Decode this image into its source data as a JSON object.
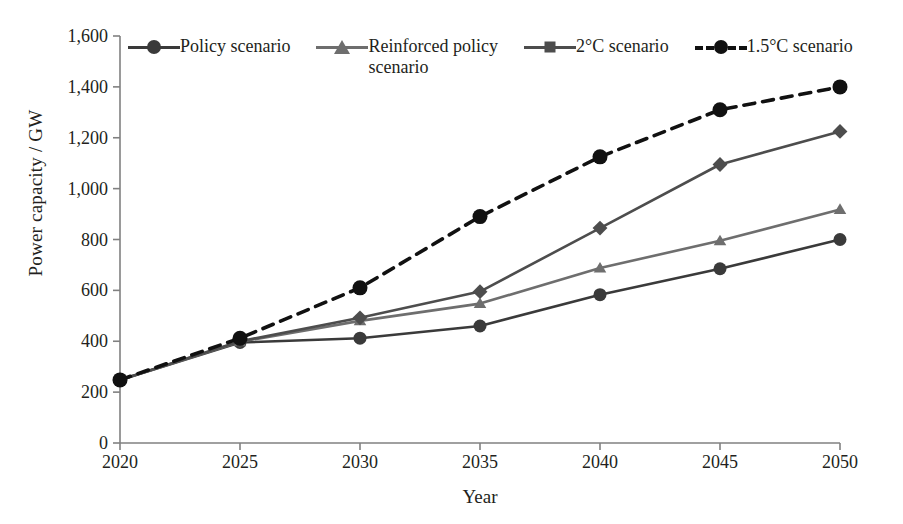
{
  "chart_data": {
    "type": "line",
    "title": "",
    "xlabel": "Year",
    "ylabel": "Power capacity / GW",
    "x": [
      2020,
      2025,
      2030,
      2035,
      2040,
      2045,
      2050
    ],
    "categories": [
      "2020",
      "2025",
      "2030",
      "2035",
      "2040",
      "2045",
      "2050"
    ],
    "xlim": [
      2020,
      2050
    ],
    "ylim": [
      0,
      1600
    ],
    "ytick_labels": [
      "0",
      "200",
      "400",
      "600",
      "800",
      "1,000",
      "1,200",
      "1,400",
      "1,600"
    ],
    "ytick_values": [
      0,
      200,
      400,
      600,
      800,
      1000,
      1200,
      1400,
      1600
    ],
    "xtick_labels": [
      "2020",
      "2025",
      "2030",
      "2035",
      "2040",
      "2045",
      "2050"
    ],
    "grid": false,
    "legend_position": "top",
    "series": [
      {
        "name": "Policy scenario",
        "marker": "circle",
        "dash": "solid",
        "color": "#3a3a3a",
        "values": [
          248,
          395,
          412,
          460,
          583,
          685,
          800
        ]
      },
      {
        "name": "Reinforced policy\nscenario",
        "legend_text": "Reinforced policy scenario",
        "marker": "triangle",
        "dash": "solid",
        "color": "#6e6e6e",
        "values": [
          248,
          398,
          480,
          548,
          688,
          795,
          918
        ]
      },
      {
        "name": "2°C scenario",
        "marker": "diamond",
        "dash": "solid",
        "color": "#4d4d4d",
        "values": [
          248,
          400,
          492,
          595,
          845,
          1095,
          1225
        ]
      },
      {
        "name": "1.5°C scenario",
        "marker": "circle",
        "dash": "dashed",
        "color": "#111111",
        "values": [
          248,
          412,
          610,
          890,
          1125,
          1310,
          1400
        ]
      }
    ]
  },
  "legend": {
    "items": [
      {
        "label": "Policy scenario"
      },
      {
        "label": "Reinforced policy\nscenario"
      },
      {
        "label": "2°C scenario"
      },
      {
        "label": "1.5°C scenario"
      }
    ]
  },
  "axes": {
    "y_title": "Power capacity / GW",
    "x_title": "Year"
  }
}
